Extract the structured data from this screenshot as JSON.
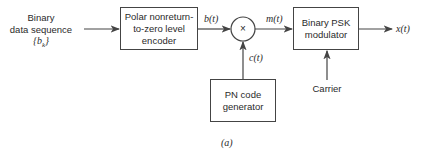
{
  "diagram": {
    "input": {
      "line1": "Binary",
      "line2": "data sequence",
      "line3": "{b",
      "line3_sub": "k",
      "line3_end": "}"
    },
    "blocks": {
      "encoder": {
        "line1": "Polar nonreturn-",
        "line2": "to-zero level",
        "line3": "encoder"
      },
      "multiplier": {
        "symbol": "×"
      },
      "pn_generator": {
        "line1": "PN code",
        "line2": "generator"
      },
      "psk_modulator": {
        "line1": "Binary PSK",
        "line2": "modulator"
      }
    },
    "signals": {
      "b": "b(t)",
      "m": "m(t)",
      "c": "c(t)",
      "x": "x(t)",
      "carrier": "Carrier"
    },
    "caption": "(a)",
    "colors": {
      "line": "#444444",
      "text": "#2a2a2a",
      "background": "#ffffff"
    }
  }
}
